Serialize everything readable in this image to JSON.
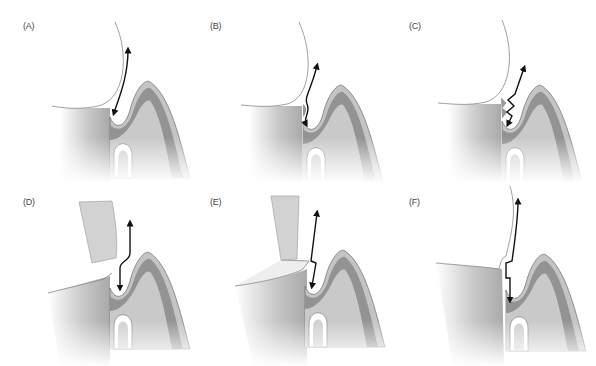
{
  "figure": {
    "panels": [
      {
        "id": "A",
        "label": "(A)",
        "description": "Rounded crown contour with smooth emergence; arrow path from gingival sulcus up along contour"
      },
      {
        "id": "B",
        "label": "(B)",
        "description": "Crown contour with small marginal discrepancy; wavy arrow path"
      },
      {
        "id": "C",
        "label": "(C)",
        "description": "Crown contour with rough/overhanging margin; zigzag arrow path"
      },
      {
        "id": "D",
        "label": "(D)",
        "description": "Flat restoration with angled instrument/block above; bent arrow path"
      },
      {
        "id": "E",
        "label": "(E)",
        "description": "Flat restoration with overhanging ledge and instrument; zigzag arrow path"
      },
      {
        "id": "F",
        "label": "(F)",
        "description": "Restoration with step/ledge at margin; stepped arrow path"
      }
    ],
    "colors": {
      "crown_outline": "#888888",
      "tooth_root": "#b5b5b5",
      "gingiva_outer": "#c8c8c8",
      "gingiva_inner": "#8f8f8f",
      "bone": "#d9d9d9",
      "arrow": "#111111",
      "instrument": "#cfcfcf"
    }
  }
}
